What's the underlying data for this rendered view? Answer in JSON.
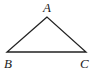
{
  "diagram": {
    "type": "triangle",
    "vertices": [
      {
        "label": "A",
        "x": 47,
        "y": 17
      },
      {
        "label": "B",
        "x": 7,
        "y": 52
      },
      {
        "label": "C",
        "x": 86,
        "y": 52
      }
    ],
    "labels": {
      "A": "A",
      "B": "B",
      "C": "C"
    },
    "stroke_color": "#222222"
  }
}
